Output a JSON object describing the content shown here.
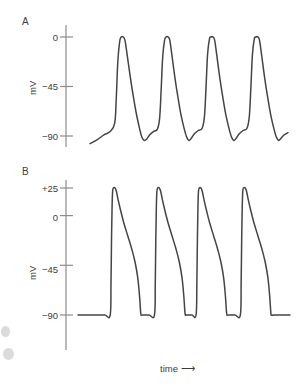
{
  "figure": {
    "panels": [
      {
        "letter": "A",
        "axis_unit": "mV",
        "tick_labels": [
          "0",
          "−45",
          "−90"
        ],
        "tick_values": [
          0,
          -45,
          -90
        ]
      },
      {
        "letter": "B",
        "axis_unit": "mV",
        "tick_labels": [
          "+25",
          "0",
          "−45",
          "−90"
        ],
        "tick_values": [
          25,
          0,
          -45,
          -90
        ]
      }
    ],
    "xlabel": "time",
    "xlabel_arrow": "⟶"
  },
  "chart_data": [
    {
      "type": "line",
      "title": "A",
      "xlabel": "time",
      "ylabel": "mV",
      "ylim": [
        -100,
        10
      ],
      "ytick_values": [
        0,
        -45,
        -90
      ],
      "ytick_labels": [
        "0",
        "−45",
        "−90"
      ],
      "grid": false,
      "legend": "none",
      "description": "Pacemaker (sinoatrial node) action potentials: slow diastolic depolarization ramp from about -90 mV, rapid upstroke to about 0 mV, rounded peak, then repolarization back toward -90 mV. Four action potentials shown.",
      "series": [
        {
          "name": "pacemaker action potential",
          "points": [
            [
              0,
              -97
            ],
            [
              5,
              -93
            ],
            [
              9,
              -89
            ],
            [
              13,
              -86
            ],
            [
              16,
              -78
            ],
            [
              17,
              -55
            ],
            [
              18,
              -22
            ],
            [
              19.2,
              -4
            ],
            [
              20.2,
              0
            ],
            [
              21.5,
              0
            ],
            [
              22.6,
              -3
            ],
            [
              24,
              -16
            ],
            [
              26,
              -36
            ],
            [
              28,
              -54
            ],
            [
              30,
              -70
            ],
            [
              32,
              -83
            ],
            [
              33.5,
              -91
            ],
            [
              35,
              -94
            ],
            [
              36.5,
              -93
            ],
            [
              38.5,
              -89
            ],
            [
              41,
              -86
            ],
            [
              43.5,
              -84
            ],
            [
              45,
              -74
            ],
            [
              46,
              -48
            ],
            [
              47,
              -18
            ],
            [
              48.2,
              -3
            ],
            [
              49.2,
              0
            ],
            [
              50.5,
              0
            ],
            [
              51.6,
              -3
            ],
            [
              53,
              -17
            ],
            [
              55,
              -38
            ],
            [
              57,
              -56
            ],
            [
              59,
              -72
            ],
            [
              61,
              -84
            ],
            [
              62.5,
              -91
            ],
            [
              64,
              -94
            ],
            [
              65.5,
              -92
            ],
            [
              67.5,
              -88
            ],
            [
              70,
              -85
            ],
            [
              72.5,
              -83
            ],
            [
              74,
              -72
            ],
            [
              75,
              -46
            ],
            [
              76,
              -16
            ],
            [
              77.2,
              -2
            ],
            [
              78.2,
              0
            ],
            [
              79.5,
              0
            ],
            [
              80.6,
              -3
            ],
            [
              82,
              -17
            ],
            [
              84,
              -38
            ],
            [
              86,
              -56
            ],
            [
              88,
              -72
            ],
            [
              90,
              -84
            ],
            [
              91.5,
              -91
            ],
            [
              93,
              -94
            ],
            [
              94.5,
              -92
            ],
            [
              96.5,
              -88
            ],
            [
              99,
              -85
            ],
            [
              101.5,
              -83
            ],
            [
              103,
              -72
            ],
            [
              104,
              -46
            ],
            [
              105,
              -16
            ],
            [
              106.2,
              -2
            ],
            [
              107.2,
              0
            ],
            [
              108.5,
              0
            ],
            [
              109.6,
              -3
            ],
            [
              111,
              -17
            ],
            [
              113,
              -38
            ],
            [
              115,
              -56
            ],
            [
              117,
              -72
            ],
            [
              119,
              -84
            ],
            [
              120.5,
              -91
            ],
            [
              122,
              -94
            ],
            [
              123.5,
              -92
            ],
            [
              125.5,
              -89
            ],
            [
              128,
              -87
            ]
          ]
        }
      ]
    },
    {
      "type": "line",
      "title": "B",
      "xlabel": "time",
      "ylabel": "mV",
      "ylim": [
        -100,
        35
      ],
      "ytick_values": [
        25,
        0,
        -45,
        -90
      ],
      "ytick_labels": [
        "+25",
        "0",
        "−45",
        "−90"
      ],
      "grid": false,
      "legend": "none",
      "description": "Ventricular (non-pacemaker) action potentials: flat stable resting potential at -90 mV, near-vertical upstroke to about +25 mV, brief rounded peak, sloping plateau and repolarization, then abrupt return to the flat -90 mV baseline. Four action potentials shown.",
      "series": [
        {
          "name": "ventricular action potential",
          "points": [
            [
              0,
              -90
            ],
            [
              14,
              -90
            ],
            [
              20,
              -90
            ],
            [
              24,
              -90
            ],
            [
              24.6,
              -60
            ],
            [
              25.0,
              -20
            ],
            [
              25.4,
              8
            ],
            [
              25.8,
              22
            ],
            [
              26.4,
              25
            ],
            [
              27.6,
              25
            ],
            [
              28.6,
              22
            ],
            [
              29.8,
              15
            ],
            [
              31.5,
              6
            ],
            [
              34,
              -6
            ],
            [
              37,
              -18
            ],
            [
              40,
              -30
            ],
            [
              42.5,
              -42
            ],
            [
              44.5,
              -56
            ],
            [
              45.8,
              -72
            ],
            [
              46.6,
              -86
            ],
            [
              47.0,
              -90
            ],
            [
              48,
              -90
            ],
            [
              53,
              -90
            ],
            [
              57,
              -90
            ],
            [
              57.6,
              -60
            ],
            [
              58.0,
              -20
            ],
            [
              58.4,
              8
            ],
            [
              58.8,
              22
            ],
            [
              59.4,
              25
            ],
            [
              60.6,
              25
            ],
            [
              61.6,
              22
            ],
            [
              62.8,
              15
            ],
            [
              64.5,
              6
            ],
            [
              67,
              -6
            ],
            [
              70,
              -18
            ],
            [
              73,
              -30
            ],
            [
              75.5,
              -42
            ],
            [
              77.5,
              -56
            ],
            [
              78.8,
              -72
            ],
            [
              79.6,
              -86
            ],
            [
              80.0,
              -90
            ],
            [
              81,
              -90
            ],
            [
              85,
              -90
            ],
            [
              88,
              -90
            ],
            [
              88.6,
              -60
            ],
            [
              89.0,
              -20
            ],
            [
              89.4,
              8
            ],
            [
              89.8,
              22
            ],
            [
              90.4,
              25
            ],
            [
              91.6,
              25
            ],
            [
              92.6,
              22
            ],
            [
              93.8,
              15
            ],
            [
              95.5,
              6
            ],
            [
              98,
              -6
            ],
            [
              101,
              -18
            ],
            [
              104,
              -30
            ],
            [
              106.5,
              -42
            ],
            [
              108.5,
              -56
            ],
            [
              109.8,
              -72
            ],
            [
              110.6,
              -86
            ],
            [
              111.0,
              -90
            ],
            [
              112,
              -90
            ],
            [
              117,
              -90
            ],
            [
              121,
              -90
            ],
            [
              121.6,
              -60
            ],
            [
              122.0,
              -20
            ],
            [
              122.4,
              8
            ],
            [
              122.8,
              22
            ],
            [
              123.4,
              25
            ],
            [
              124.6,
              25
            ],
            [
              125.6,
              22
            ],
            [
              126.8,
              15
            ],
            [
              128.5,
              6
            ],
            [
              131,
              -6
            ],
            [
              134,
              -18
            ],
            [
              137,
              -30
            ],
            [
              139.5,
              -42
            ],
            [
              141.5,
              -56
            ],
            [
              142.8,
              -72
            ],
            [
              143.6,
              -86
            ],
            [
              144.0,
              -90
            ],
            [
              146,
              -90
            ],
            [
              152,
              -90
            ],
            [
              158,
              -90
            ]
          ]
        }
      ]
    }
  ]
}
